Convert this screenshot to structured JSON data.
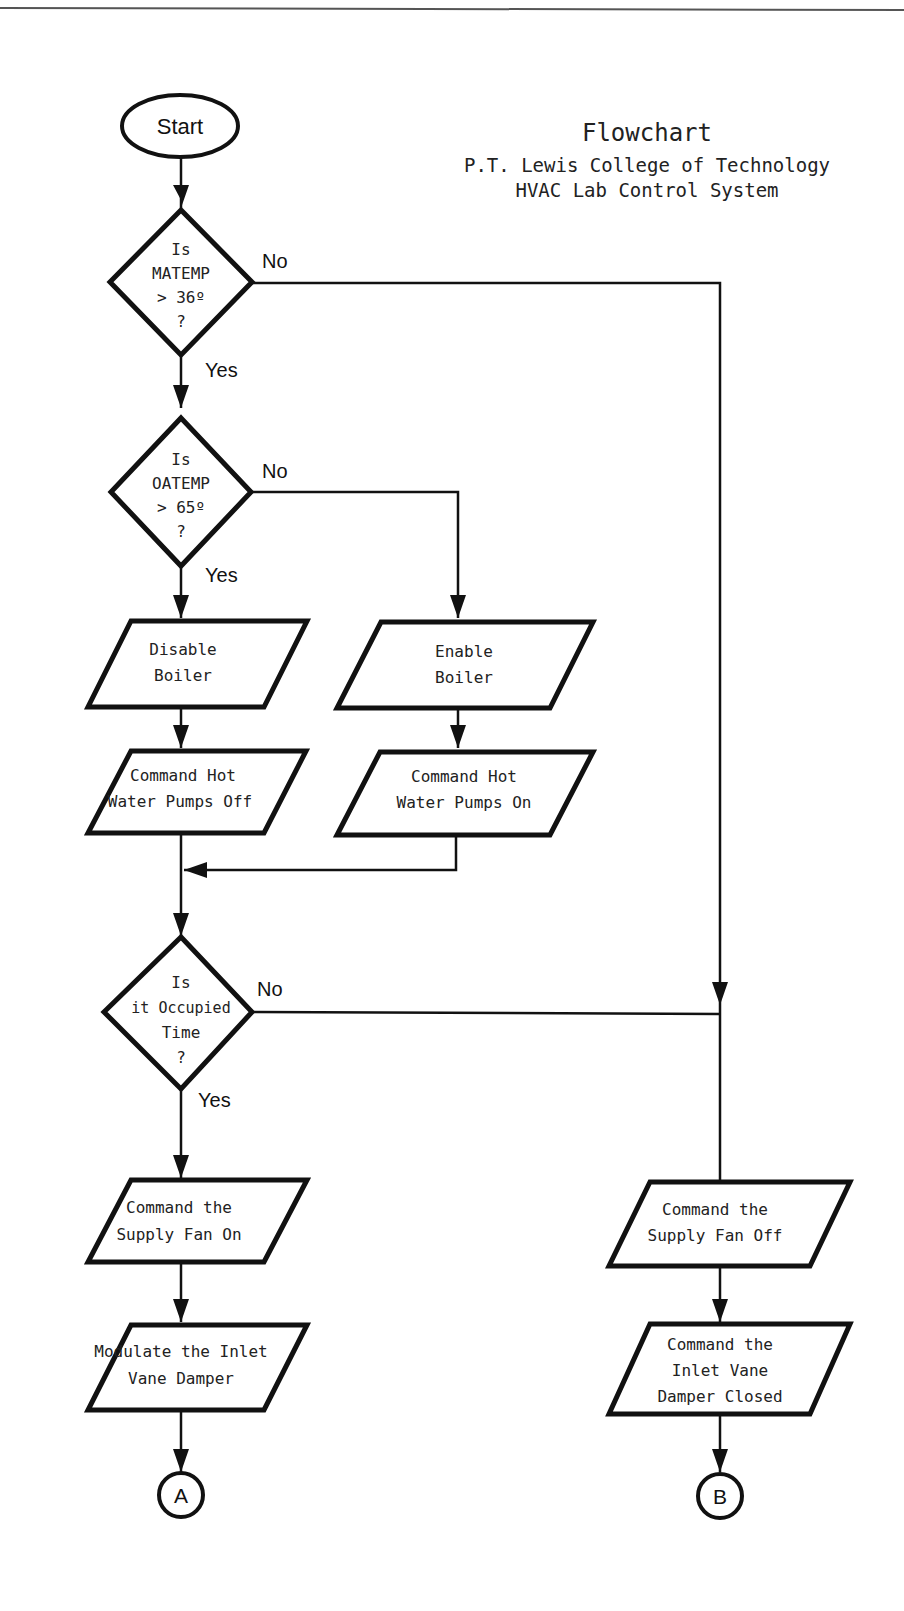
{
  "header": {
    "title": "Flowchart",
    "subtitle_line1": "P.T. Lewis College of Technology",
    "subtitle_line2": "HVAC Lab Control System"
  },
  "nodes": {
    "start": {
      "label": "Start"
    },
    "decision_matemp": {
      "lines": [
        "Is",
        "MATEMP",
        "> 36º",
        "?"
      ]
    },
    "decision_oatemp": {
      "lines": [
        "Is",
        "OATEMP",
        "> 65º",
        "?"
      ]
    },
    "disable_boiler": {
      "lines": [
        "Disable",
        "Boiler"
      ]
    },
    "enable_boiler": {
      "lines": [
        "Enable",
        "Boiler"
      ]
    },
    "pumps_off": {
      "lines": [
        "Command Hot",
        "Water Pumps Off"
      ]
    },
    "pumps_on": {
      "lines": [
        "Command Hot",
        "Water Pumps On"
      ]
    },
    "decision_occupied": {
      "lines": [
        "Is",
        "it Occupied",
        "Time",
        "?"
      ]
    },
    "fan_on": {
      "lines": [
        "Command the",
        "Supply Fan On"
      ]
    },
    "modulate_damper": {
      "lines": [
        "Modulate the Inlet",
        "Vane Damper"
      ]
    },
    "fan_off": {
      "lines": [
        "Command the",
        "Supply Fan Off"
      ]
    },
    "damper_closed": {
      "lines": [
        "Command the",
        "Inlet Vane",
        "Damper Closed"
      ]
    },
    "connector_a": {
      "label": "A"
    },
    "connector_b": {
      "label": "B"
    }
  },
  "edge_labels": {
    "matemp_no": "No",
    "matemp_yes": "Yes",
    "oatemp_no": "No",
    "oatemp_yes": "Yes",
    "occupied_no": "No",
    "occupied_yes": "Yes"
  }
}
